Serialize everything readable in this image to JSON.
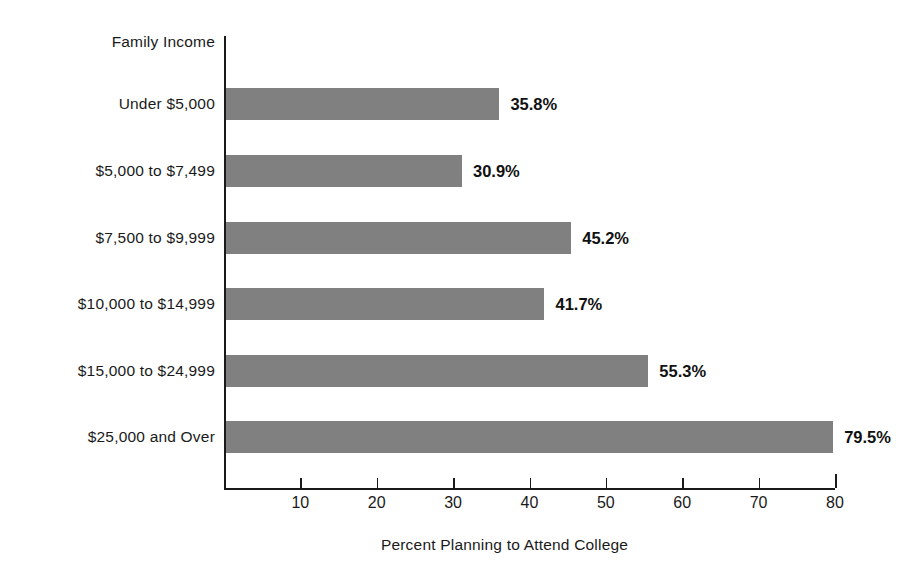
{
  "chart_data": {
    "type": "bar",
    "orientation": "horizontal",
    "title": "",
    "xlabel": "Percent Planning to Attend College",
    "ylabel": "Family Income",
    "categories": [
      "Under $5,000",
      "$5,000 to $7,499",
      "$7,500 to $9,999",
      "$10,000 to $14,999",
      "$15,000 to $24,999",
      "$25,000 and Over"
    ],
    "values": [
      35.8,
      30.9,
      45.2,
      41.7,
      55.3,
      79.5
    ],
    "value_labels": [
      "35.8%",
      "30.9%",
      "45.2%",
      "41.7%",
      "55.3%",
      "79.5%"
    ],
    "xlim": [
      0,
      80
    ],
    "xticks": [
      10,
      20,
      30,
      40,
      50,
      60,
      70,
      80
    ],
    "xtick_labels": [
      "10",
      "20",
      "30",
      "40",
      "50",
      "60",
      "70",
      "80"
    ],
    "grid": false,
    "legend": false,
    "bar_color": "#808080",
    "axis_color": "#1a1a1a",
    "background": "#ffffff"
  }
}
